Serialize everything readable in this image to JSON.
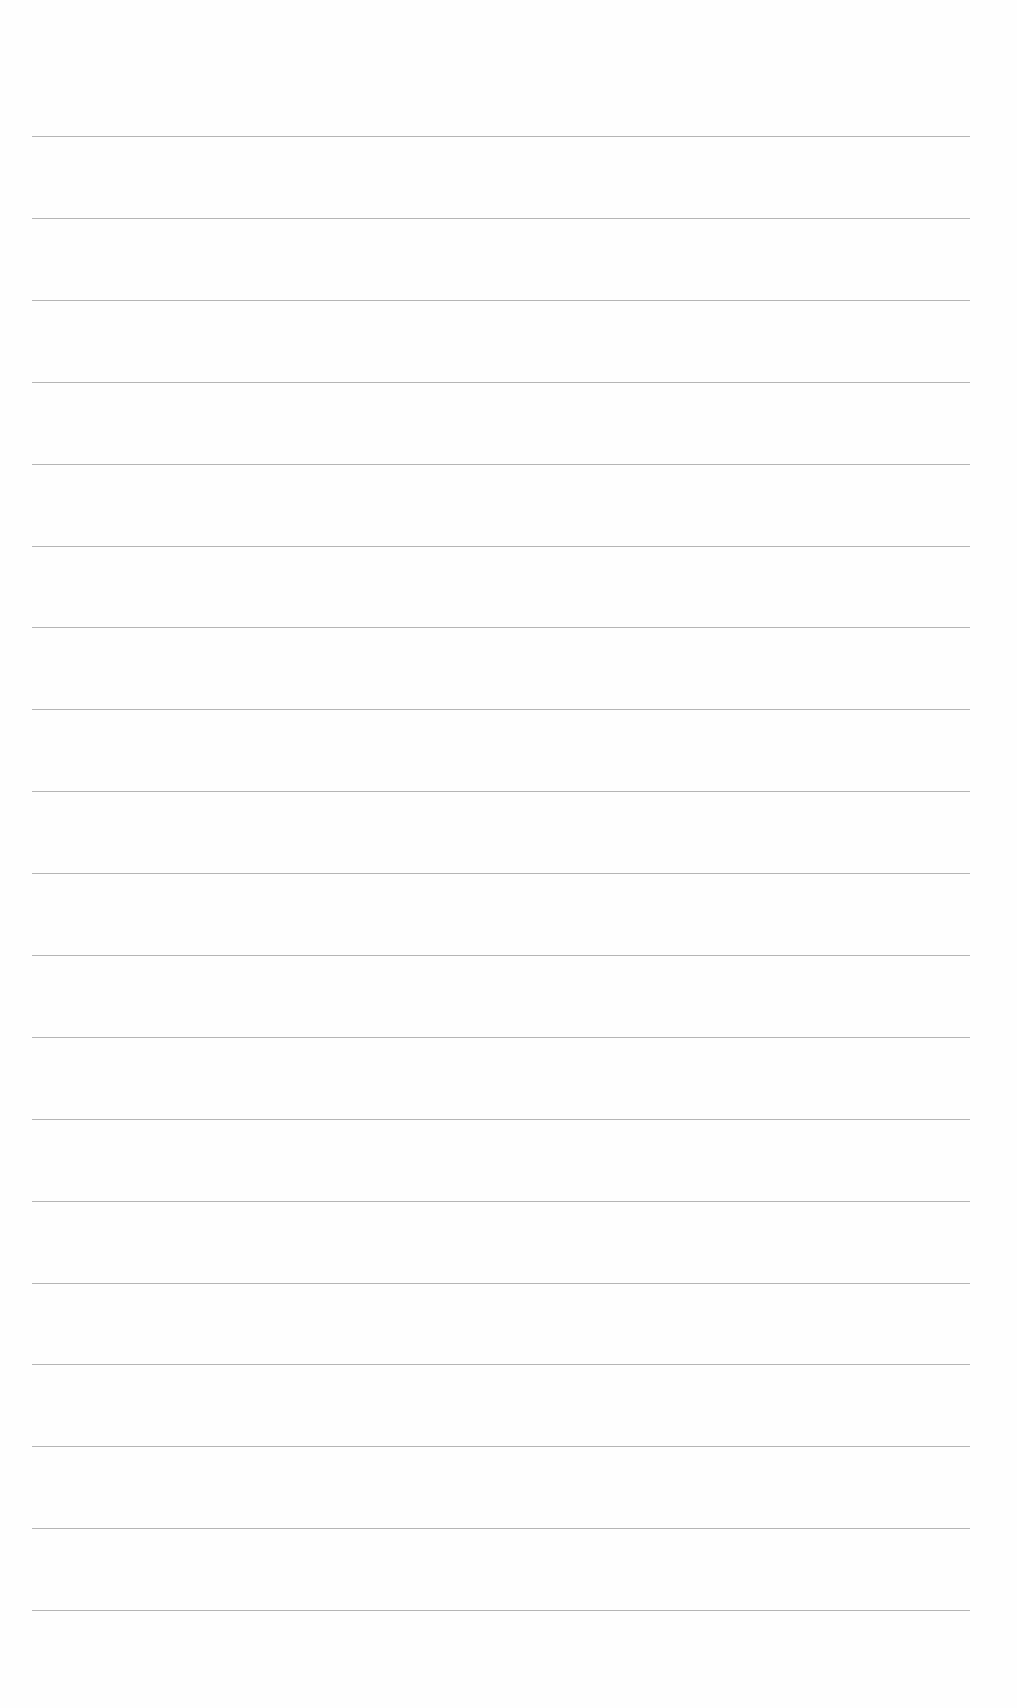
{
  "page": {
    "type": "blank lined paper",
    "line_count": 19,
    "line_color": "#a8a8a8",
    "background_color": "#fefefe",
    "lines": [
      {
        "y": 136
      },
      {
        "y": 218
      },
      {
        "y": 300
      },
      {
        "y": 382
      },
      {
        "y": 464
      },
      {
        "y": 546
      },
      {
        "y": 627
      },
      {
        "y": 709
      },
      {
        "y": 791
      },
      {
        "y": 873
      },
      {
        "y": 955
      },
      {
        "y": 1037
      },
      {
        "y": 1119
      },
      {
        "y": 1201
      },
      {
        "y": 1283
      },
      {
        "y": 1364
      },
      {
        "y": 1446
      },
      {
        "y": 1528
      },
      {
        "y": 1610
      }
    ]
  }
}
